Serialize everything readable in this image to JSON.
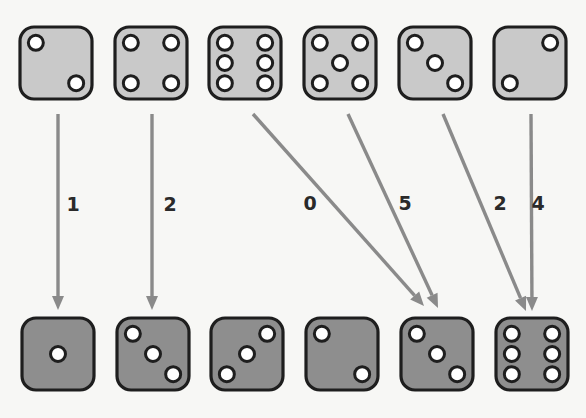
{
  "top_row": {
    "description": "original dice",
    "dice": [
      2,
      4,
      6,
      5,
      3,
      2
    ],
    "pip_layouts": [
      "diag-tl-br",
      "four",
      "six",
      "five",
      "three-tl-br",
      "diag-tr-bl"
    ]
  },
  "bottom_row": {
    "description": "target dice",
    "dice": [
      1,
      3,
      3,
      2,
      3,
      6
    ],
    "pip_layouts": [
      "one",
      "three-tl-br",
      "three-tr-bl",
      "diag-tl-br",
      "three-tl-br",
      "six"
    ]
  },
  "arrows": [
    {
      "from": 0,
      "to": 0,
      "label": "1"
    },
    {
      "from": 1,
      "to": 1,
      "label": "2"
    },
    {
      "from": 2,
      "to": 4,
      "label": "0"
    },
    {
      "from": 3,
      "to": 4,
      "label": "5"
    },
    {
      "from": 4,
      "to": 5,
      "label": "2"
    },
    {
      "from": 5,
      "to": 5,
      "label": "4"
    }
  ],
  "colors": {
    "background": "#f7f7f5",
    "top_die_fill": "#c9c9c9",
    "bottom_die_fill": "#8e8e8e",
    "outline": "#1e1e1e",
    "arrow": "#8a8a8a"
  }
}
